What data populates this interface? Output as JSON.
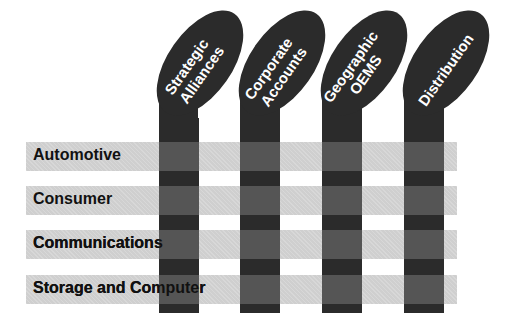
{
  "diagram": {
    "type": "matrix",
    "columns": [
      {
        "label_line1": "Strategic",
        "label_line2": "Alliances"
      },
      {
        "label_line1": "Corporate",
        "label_line2": "Accounts"
      },
      {
        "label_line1": "Geographic",
        "label_line2": "OEMS"
      },
      {
        "label_line1": "Distribution",
        "label_line2": ""
      }
    ],
    "rows": [
      {
        "label": "Automotive"
      },
      {
        "label": "Consumer"
      },
      {
        "label": "Communications"
      },
      {
        "label": "Storage and Computer"
      }
    ],
    "colors": {
      "column": "#2b2b2b",
      "row_band": "#cfcfcf",
      "intersection": "#5f5f5f",
      "text_dark": "#111111",
      "text_light": "#ffffff"
    }
  }
}
